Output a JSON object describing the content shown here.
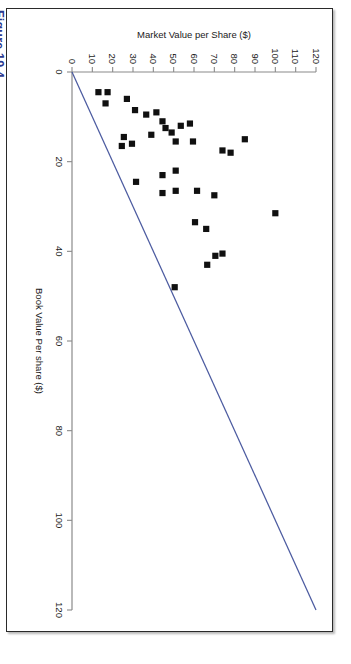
{
  "figure": {
    "caption": "Figure 19.4"
  },
  "chart_data": {
    "type": "scatter",
    "title": "",
    "xlabel": "Book Value Per share ($)",
    "ylabel": "Market Value per Share ($)",
    "xlim": [
      0,
      120
    ],
    "ylim": [
      0,
      120
    ],
    "x_ticks": [
      0,
      20,
      40,
      60,
      80,
      100,
      120
    ],
    "y_ticks": [
      0,
      10,
      20,
      30,
      40,
      50,
      60,
      70,
      80,
      90,
      100,
      110,
      120
    ],
    "grid": false,
    "legend": "none",
    "marker_shape": "square",
    "marker_color": "#101010",
    "reference_line": {
      "label": "45-degree reference line",
      "color": "#4c5ba0",
      "from": [
        0,
        0
      ],
      "to": [
        120,
        120
      ]
    },
    "points": [
      {
        "x": 4.5,
        "y": 17.5
      },
      {
        "x": 4.5,
        "y": 13.0
      },
      {
        "x": 7.0,
        "y": 16.5
      },
      {
        "x": 8.5,
        "y": 31.0
      },
      {
        "x": 9.0,
        "y": 41.5
      },
      {
        "x": 11.0,
        "y": 44.5
      },
      {
        "x": 12.0,
        "y": 53.5
      },
      {
        "x": 12.5,
        "y": 46.0
      },
      {
        "x": 13.5,
        "y": 49.0
      },
      {
        "x": 14.0,
        "y": 39.0
      },
      {
        "x": 14.5,
        "y": 25.5
      },
      {
        "x": 15.0,
        "y": 85.0
      },
      {
        "x": 15.5,
        "y": 51.0
      },
      {
        "x": 15.5,
        "y": 59.5
      },
      {
        "x": 16.0,
        "y": 29.5
      },
      {
        "x": 16.5,
        "y": 24.5
      },
      {
        "x": 17.5,
        "y": 74.0
      },
      {
        "x": 18.0,
        "y": 78.0
      },
      {
        "x": 22.0,
        "y": 51.0
      },
      {
        "x": 23.0,
        "y": 44.5
      },
      {
        "x": 24.5,
        "y": 31.5
      },
      {
        "x": 26.5,
        "y": 61.5
      },
      {
        "x": 26.5,
        "y": 51.0
      },
      {
        "x": 27.0,
        "y": 44.5
      },
      {
        "x": 27.5,
        "y": 70.0
      },
      {
        "x": 31.5,
        "y": 100.0
      },
      {
        "x": 33.5,
        "y": 60.5
      },
      {
        "x": 35.0,
        "y": 66.0
      },
      {
        "x": 40.5,
        "y": 74.0
      },
      {
        "x": 41.0,
        "y": 70.5
      },
      {
        "x": 43.0,
        "y": 66.5
      },
      {
        "x": 48.0,
        "y": 50.5
      },
      {
        "x": 6.0,
        "y": 27.0
      },
      {
        "x": 9.5,
        "y": 36.5
      },
      {
        "x": 11.5,
        "y": 58.0
      }
    ]
  }
}
